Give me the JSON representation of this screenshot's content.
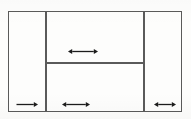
{
  "diagram": {
    "type": "line-diagram",
    "background_color": "#fdfdfc",
    "line_color": "#5a5a5a",
    "arrow_color": "#1c1c1c",
    "canvas": {
      "width": 191,
      "height": 119
    },
    "frame": {
      "x": 8,
      "y": 11,
      "width": 174,
      "height": 101
    },
    "dividers": [
      {
        "name": "left-vertical-divider",
        "orientation": "vertical",
        "x": 45,
        "y1": 11,
        "y2": 112
      },
      {
        "name": "right-vertical-divider",
        "orientation": "vertical",
        "x": 143,
        "y1": 11,
        "y2": 112
      },
      {
        "name": "middle-horizontal-divider",
        "orientation": "horizontal",
        "y": 62,
        "x1": 45,
        "x2": 143
      }
    ],
    "regions": [
      {
        "name": "left-column",
        "label": ""
      },
      {
        "name": "center-upper",
        "label": ""
      },
      {
        "name": "center-lower",
        "label": ""
      },
      {
        "name": "right-column",
        "label": ""
      }
    ],
    "arrows": [
      {
        "name": "center-upper-width-arrow",
        "style": "double-headed",
        "direction": "horizontal",
        "x": 68,
        "y": 47,
        "length": 30,
        "label": ""
      },
      {
        "name": "left-column-width-arrow",
        "style": "single-headed-right",
        "direction": "horizontal",
        "x": 16,
        "y": 100,
        "length": 22,
        "label": ""
      },
      {
        "name": "center-lower-width-arrow",
        "style": "double-headed",
        "direction": "horizontal",
        "x": 62,
        "y": 100,
        "length": 28,
        "label": ""
      },
      {
        "name": "right-column-width-arrow",
        "style": "double-headed",
        "direction": "horizontal",
        "x": 154,
        "y": 100,
        "length": 22,
        "label": ""
      }
    ]
  }
}
